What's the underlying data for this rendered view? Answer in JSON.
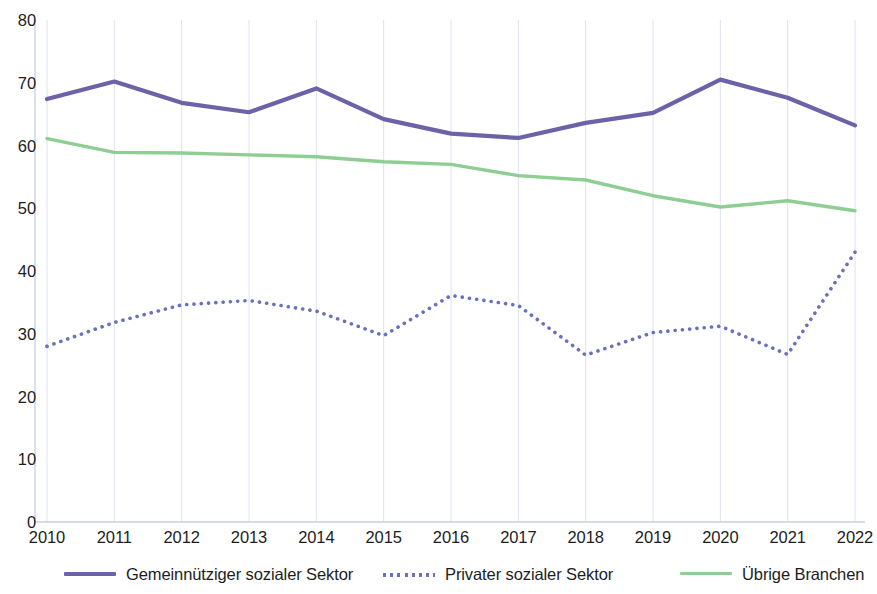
{
  "chart_data": {
    "type": "line",
    "title": "",
    "subtitle": "",
    "xlabel": "",
    "ylabel": "",
    "xlim": [
      2010,
      2022
    ],
    "ylim": [
      0,
      80
    ],
    "ytick_step": 10,
    "grid": "vertical",
    "legend_position": "bottom",
    "categories": [
      "2010",
      "2011",
      "2012",
      "2013",
      "2014",
      "2015",
      "2016",
      "2017",
      "2018",
      "2019",
      "2020",
      "2021",
      "2022"
    ],
    "yticks": [
      "0",
      "10",
      "20",
      "30",
      "40",
      "50",
      "60",
      "70",
      "80"
    ],
    "series": [
      {
        "name": "Gemeinnütziger sozialer Sektor",
        "color": "#6B62A8",
        "style": "solid",
        "width": 4.2,
        "values": [
          67.4,
          70.2,
          66.8,
          65.3,
          69.1,
          64.2,
          61.9,
          61.2,
          63.6,
          65.2,
          70.5,
          67.6,
          63.2
        ]
      },
      {
        "name": "Privater sozialer Sektor",
        "color": "#6A6FC0",
        "style": "dotted",
        "width": 3.6,
        "values": [
          28.0,
          31.8,
          34.6,
          35.3,
          33.6,
          29.7,
          36.1,
          34.5,
          26.6,
          30.2,
          31.2,
          26.7,
          43.0
        ]
      },
      {
        "name": "Übrige Branchen",
        "color": "#8FCE93",
        "style": "solid",
        "width": 3.4,
        "values": [
          61.1,
          58.9,
          58.8,
          58.5,
          58.2,
          57.4,
          57.0,
          55.2,
          54.5,
          52.0,
          50.2,
          51.2,
          49.6
        ]
      }
    ]
  },
  "legend": {
    "items": [
      {
        "label": "Gemeinnütziger sozialer Sektor",
        "color": "#6B62A8",
        "style": "solid",
        "icon": "line-swatch-icon"
      },
      {
        "label": "Privater sozialer Sektor",
        "color": "#6A6FC0",
        "style": "dotted",
        "icon": "dotted-line-swatch-icon"
      },
      {
        "label": "Übrige Branchen",
        "color": "#8FCE93",
        "style": "solid",
        "icon": "line-swatch-icon"
      }
    ]
  },
  "layout": {
    "plot_left": 47,
    "plot_right": 855,
    "plot_top": 20,
    "plot_bottom": 522,
    "gridline_color": "#DCE3F0",
    "axis_color": "#C9CFDC",
    "background": "#ffffff",
    "legend_x": [
      64,
      383,
      680
    ],
    "legend_label_x": [
      128,
      447,
      738
    ]
  }
}
